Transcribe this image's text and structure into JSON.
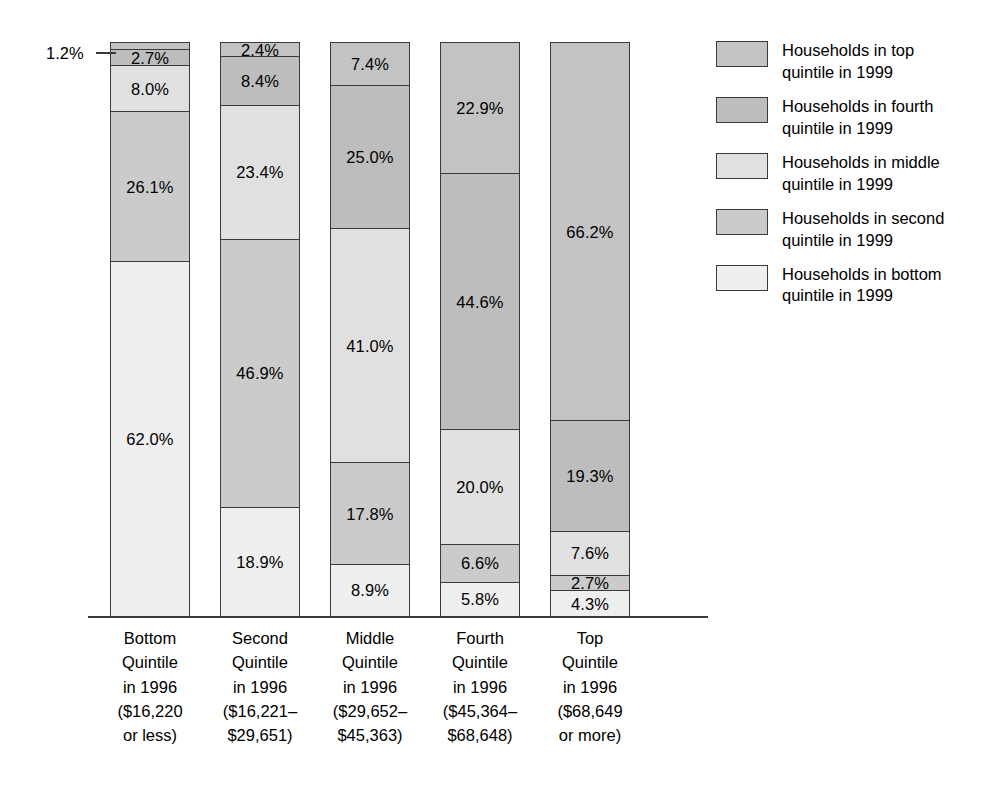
{
  "chart_data": {
    "type": "bar",
    "subtype": "stacked-percent",
    "title": "",
    "xlabel": "",
    "ylabel": "",
    "ylim": [
      0,
      100
    ],
    "grid": false,
    "legend_position": "right",
    "categories": [
      "Bottom Quintile in 1996 ($16,220 or less)",
      "Second Quintile in 1996 ($16,221-$29,651)",
      "Middle Quintile in 1996 ($29,652-$45,363)",
      "Fourth Quintile in 1996 ($45,364-$68,648)",
      "Top Quintile in 1996 ($68,649 or more)"
    ],
    "series": [
      {
        "name": "Households in top quintile in 1999",
        "values": [
          1.2,
          2.4,
          7.4,
          22.9,
          66.2
        ]
      },
      {
        "name": "Households in fourth quintile in 1999",
        "values": [
          2.7,
          8.4,
          25.0,
          44.6,
          19.3
        ]
      },
      {
        "name": "Households in middle quintile in 1999",
        "values": [
          8.0,
          23.4,
          41.0,
          20.0,
          7.6
        ]
      },
      {
        "name": "Households in second quintile in 1999",
        "values": [
          26.1,
          46.9,
          17.8,
          6.6,
          2.7
        ]
      },
      {
        "name": "Households in bottom quintile in 1999",
        "values": [
          62.0,
          18.9,
          8.9,
          5.8,
          4.3
        ]
      }
    ],
    "annotations": [
      {
        "text": "1.2%",
        "target": "bar1-top-quintile-segment",
        "leader_line": true
      }
    ]
  },
  "colors": {
    "top": "#c3c3c3",
    "fourth": "#bdbdbd",
    "middle": "#e0e0e0",
    "second": "#cbcbcb",
    "bottom": "#efefef",
    "outline": "#3a3a3a",
    "text": "#000000",
    "background": "#ffffff"
  },
  "callout": {
    "label": "1.2%"
  },
  "bars": [
    {
      "id": "bottom-quintile-1996",
      "segments": [
        {
          "key": "top",
          "label": "1.2%",
          "value": 1.2,
          "show_label": false
        },
        {
          "key": "fourth",
          "label": "2.7%",
          "value": 2.7,
          "show_label": true
        },
        {
          "key": "middle",
          "label": "8.0%",
          "value": 8.0,
          "show_label": true
        },
        {
          "key": "second",
          "label": "26.1%",
          "value": 26.1,
          "show_label": true
        },
        {
          "key": "bottom",
          "label": "62.0%",
          "value": 62.0,
          "show_label": true
        }
      ]
    },
    {
      "id": "second-quintile-1996",
      "segments": [
        {
          "key": "top",
          "label": "2.4%",
          "value": 2.4,
          "show_label": true
        },
        {
          "key": "fourth",
          "label": "8.4%",
          "value": 8.4,
          "show_label": true
        },
        {
          "key": "middle",
          "label": "23.4%",
          "value": 23.4,
          "show_label": true
        },
        {
          "key": "second",
          "label": "46.9%",
          "value": 46.9,
          "show_label": true
        },
        {
          "key": "bottom",
          "label": "18.9%",
          "value": 18.9,
          "show_label": true
        }
      ]
    },
    {
      "id": "middle-quintile-1996",
      "segments": [
        {
          "key": "top",
          "label": "7.4%",
          "value": 7.4,
          "show_label": true
        },
        {
          "key": "fourth",
          "label": "25.0%",
          "value": 25.0,
          "show_label": true
        },
        {
          "key": "middle",
          "label": "41.0%",
          "value": 41.0,
          "show_label": true
        },
        {
          "key": "second",
          "label": "17.8%",
          "value": 17.8,
          "show_label": true
        },
        {
          "key": "bottom",
          "label": "8.9%",
          "value": 8.9,
          "show_label": true
        }
      ]
    },
    {
      "id": "fourth-quintile-1996",
      "segments": [
        {
          "key": "top",
          "label": "22.9%",
          "value": 22.9,
          "show_label": true
        },
        {
          "key": "fourth",
          "label": "44.6%",
          "value": 44.6,
          "show_label": true
        },
        {
          "key": "middle",
          "label": "20.0%",
          "value": 20.0,
          "show_label": true
        },
        {
          "key": "second",
          "label": "6.6%",
          "value": 6.6,
          "show_label": true
        },
        {
          "key": "bottom",
          "label": "5.8%",
          "value": 5.8,
          "show_label": true
        }
      ]
    },
    {
      "id": "top-quintile-1996",
      "segments": [
        {
          "key": "top",
          "label": "66.2%",
          "value": 66.2,
          "show_label": true
        },
        {
          "key": "fourth",
          "label": "19.3%",
          "value": 19.3,
          "show_label": true
        },
        {
          "key": "middle",
          "label": "7.6%",
          "value": 7.6,
          "show_label": true
        },
        {
          "key": "second",
          "label": "2.7%",
          "value": 2.7,
          "show_label": true
        },
        {
          "key": "bottom",
          "label": "4.3%",
          "value": 4.3,
          "show_label": true
        }
      ]
    }
  ],
  "category_labels": [
    {
      "id": "bottom-quintile-1996",
      "lines": [
        "Bottom",
        "Quintile",
        "in 1996",
        "($16,220",
        "or less)"
      ]
    },
    {
      "id": "second-quintile-1996",
      "lines": [
        "Second",
        "Quintile",
        "in 1996",
        "($16,221–",
        "$29,651)"
      ]
    },
    {
      "id": "middle-quintile-1996",
      "lines": [
        "Middle",
        "Quintile",
        "in 1996",
        "($29,652–",
        "$45,363)"
      ]
    },
    {
      "id": "fourth-quintile-1996",
      "lines": [
        "Fourth",
        "Quintile",
        "in 1996",
        "($45,364–",
        "$68,648)"
      ]
    },
    {
      "id": "top-quintile-1996",
      "lines": [
        "Top",
        "Quintile",
        "in 1996",
        "($68,649",
        "or more)"
      ]
    }
  ],
  "legend": {
    "items": [
      {
        "key": "top",
        "lines": [
          "Households in top",
          "quintile in 1999"
        ]
      },
      {
        "key": "fourth",
        "lines": [
          "Households in fourth",
          "quintile in 1999"
        ]
      },
      {
        "key": "middle",
        "lines": [
          "Households in middle",
          "quintile in 1999"
        ]
      },
      {
        "key": "second",
        "lines": [
          "Households in second",
          "quintile in 1999"
        ]
      },
      {
        "key": "bottom",
        "lines": [
          "Households in bottom",
          "quintile in 1999"
        ]
      }
    ]
  }
}
